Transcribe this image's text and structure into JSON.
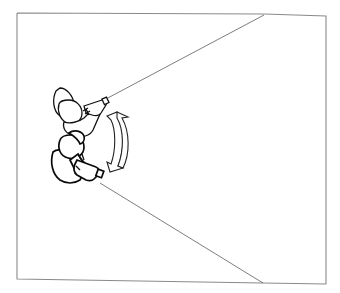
{
  "diagram": {
    "frame": {
      "x1": 17,
      "y1": 13,
      "x2": 326,
      "y2": 283
    },
    "colors": {
      "background": "#ffffff",
      "frame": "#8a8a8a",
      "ink": "#111111",
      "sight_lines": "#6e6e6e"
    },
    "elements": [
      {
        "name": "operator-upper",
        "type": "person-top-view",
        "holding": "camera"
      },
      {
        "name": "operator-lower",
        "type": "person-top-view",
        "holding": "camera"
      },
      {
        "name": "sight-line-upper",
        "type": "line",
        "from": [
          104,
          100
        ],
        "to": [
          264,
          15
        ]
      },
      {
        "name": "sight-line-lower",
        "type": "line",
        "from": [
          100,
          183
        ],
        "to": [
          263,
          283
        ]
      },
      {
        "name": "pan-arrow",
        "type": "curved-double-arrow",
        "direction": "vertical"
      }
    ]
  }
}
